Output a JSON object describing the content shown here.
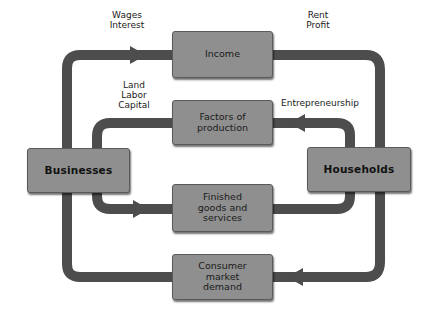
{
  "diagram": {
    "type": "circular-flow",
    "colors": {
      "background": "#ffffff",
      "box_fill": "#8f8f8f",
      "pipe": "#4d4d4d",
      "text": "#1a1a1a"
    },
    "actors": {
      "businesses": "Businesses",
      "households": "Households"
    },
    "flows": {
      "income": "Income",
      "factors": "Factors of\nproduction",
      "finished": "Finished\ngoods and\nservices",
      "consumer": "Consumer\nmarket\ndemand"
    },
    "labels": {
      "wages_interest": "Wages\nInterest",
      "rent_profit": "Rent\nProfit",
      "land_labor_capital": "Land\nLabor\nCapital",
      "entrepreneurship": "Entrepreneurship"
    },
    "edges": [
      {
        "from": "Businesses",
        "to": "Income",
        "arrow": "right",
        "label": "Wages Interest"
      },
      {
        "from": "Income",
        "to": "Households",
        "label": "Rent Profit"
      },
      {
        "from": "Households",
        "to": "Factors of production",
        "arrow": "left",
        "label": "Entrepreneurship"
      },
      {
        "from": "Factors of production",
        "to": "Businesses",
        "label": "Land Labor Capital"
      },
      {
        "from": "Businesses",
        "to": "Finished goods and services",
        "arrow": "right"
      },
      {
        "from": "Finished goods and services",
        "to": "Households"
      },
      {
        "from": "Households",
        "to": "Consumer market demand",
        "arrow": "left"
      },
      {
        "from": "Consumer market demand",
        "to": "Businesses"
      }
    ]
  }
}
